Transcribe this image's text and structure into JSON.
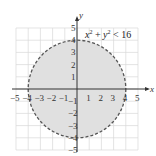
{
  "chart_data": {
    "type": "region",
    "title": "",
    "inequality": "x² + y² < 16",
    "shape": "circle",
    "center": [
      0,
      0
    ],
    "radius": 4,
    "boundary": "dashed",
    "fill": "shaded interior",
    "xlabel": "x",
    "ylabel": "y",
    "xlim": [
      -5,
      5
    ],
    "ylim": [
      -5,
      5
    ],
    "grid": true,
    "x_ticks": [
      "-5",
      "-4",
      "-3",
      "-2",
      "-1",
      "1",
      "2",
      "3",
      "4",
      "5"
    ],
    "y_ticks": [
      "5",
      "4",
      "3",
      "2",
      "1",
      "-1",
      "-2",
      "-3",
      "-4",
      "-5"
    ]
  },
  "colors": {
    "fill": "#e0e0e0",
    "boundary": "#555555",
    "grid": "#d8d8d8",
    "axis": "#333333"
  }
}
